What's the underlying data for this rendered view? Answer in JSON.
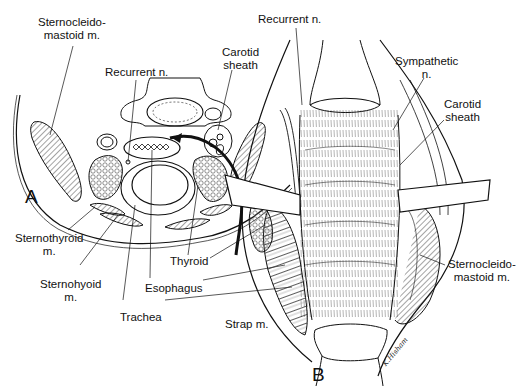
{
  "figure": {
    "panels": [
      {
        "id": "A",
        "label": "A",
        "description": "Axial cross-section of the neck"
      },
      {
        "id": "B",
        "label": "B",
        "description": "Anterior operative view of exposed esophagus/trachea"
      }
    ],
    "panel_a_labels": {
      "sternocleidomastoid_line1": "Sternocleido-",
      "sternocleidomastoid_line2": "mastoid m.",
      "recurrent_n": "Recurrent n.",
      "carotid_line1": "Carotid",
      "carotid_line2": "sheath",
      "sternothyroid_line1": "Sternothyroid",
      "sternothyroid_line2": "m.",
      "sternohyoid_line1": "Sternohyoid",
      "sternohyoid_line2": "m.",
      "trachea": "Trachea",
      "esophagus": "Esophagus",
      "thyroid": "Thyroid"
    },
    "panel_b_labels": {
      "recurrent_n": "Recurrent n.",
      "sympathetic_line1": "Sympathetic",
      "sympathetic_line2": "n.",
      "carotid_line1": "Carotid",
      "carotid_line2": "sheath",
      "sternocleidomastoid_line1": "Sternocleido-",
      "sternocleidomastoid_line2": "mastoid m.",
      "strap": "Strap m."
    },
    "signature": "K.Hisham",
    "colors": {
      "ink": "#111111",
      "background": "#ffffff",
      "hatch": "#555555"
    }
  }
}
